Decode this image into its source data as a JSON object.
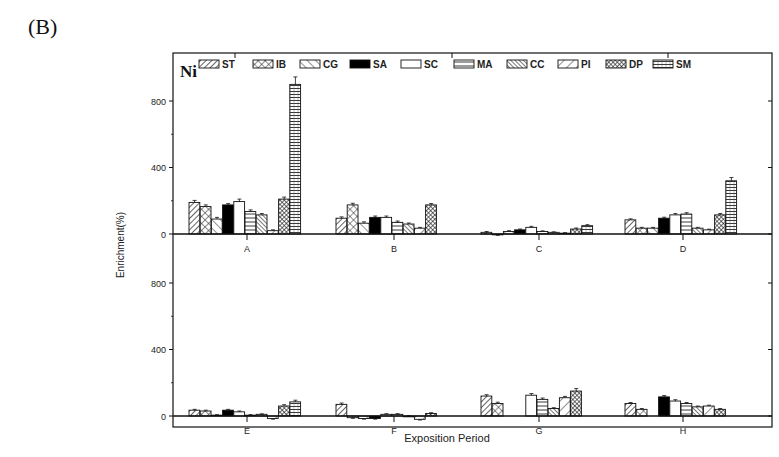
{
  "figure": {
    "panel_label": "(B)",
    "element_label": "Ni",
    "xlabel": "Exposition Period",
    "ylabel": "Enrichment(%)"
  },
  "legend": [
    {
      "key": "ST",
      "pattern": "diag-right"
    },
    {
      "key": "IB",
      "pattern": "crosshatch"
    },
    {
      "key": "CG",
      "pattern": "diag-left"
    },
    {
      "key": "SA",
      "pattern": "solid-black"
    },
    {
      "key": "SC",
      "pattern": "white"
    },
    {
      "key": "MA",
      "pattern": "horizontal"
    },
    {
      "key": "CC",
      "pattern": "dense-diag-left"
    },
    {
      "key": "PI",
      "pattern": "wide-diag-right"
    },
    {
      "key": "DP",
      "pattern": "dense-crosshatch"
    },
    {
      "key": "SM",
      "pattern": "horizontal-grid"
    }
  ],
  "chart_data": {
    "type": "bar",
    "title": "Ni",
    "xlabel": "Exposition Period",
    "ylabel": "Enrichment(%)",
    "series_names": [
      "ST",
      "IB",
      "CG",
      "SA",
      "SC",
      "MA",
      "CC",
      "PI",
      "DP",
      "SM"
    ],
    "panels": [
      {
        "position": "top",
        "ylim": [
          -40,
          1000
        ],
        "yticks": [
          0,
          400,
          800
        ],
        "categories": [
          "A",
          "B",
          "C",
          "D"
        ],
        "values": {
          "A": [
            190,
            165,
            90,
            175,
            195,
            135,
            115,
            20,
            210,
            900
          ],
          "B": [
            95,
            175,
            65,
            100,
            100,
            70,
            60,
            35,
            175,
            null
          ],
          "C": [
            10,
            -5,
            15,
            25,
            40,
            15,
            10,
            5,
            30,
            50
          ],
          "D": [
            85,
            35,
            35,
            95,
            115,
            120,
            35,
            25,
            115,
            320
          ]
        },
        "errors": {
          "A": [
            12,
            10,
            10,
            8,
            15,
            10,
            8,
            5,
            12,
            45
          ],
          "B": [
            8,
            10,
            8,
            8,
            8,
            8,
            6,
            5,
            8,
            null
          ],
          "C": [
            5,
            3,
            5,
            5,
            6,
            4,
            3,
            3,
            6,
            6
          ],
          "D": [
            6,
            5,
            5,
            6,
            8,
            8,
            5,
            4,
            8,
            20
          ]
        }
      },
      {
        "position": "bottom",
        "ylim": [
          -40,
          1000
        ],
        "yticks": [
          0,
          400,
          800
        ],
        "categories": [
          "E",
          "F",
          "G",
          "H"
        ],
        "values": {
          "E": [
            35,
            30,
            5,
            35,
            25,
            5,
            10,
            -15,
            60,
            85
          ],
          "F": [
            70,
            -10,
            -15,
            -15,
            10,
            10,
            0,
            -20,
            15,
            null
          ],
          "G": [
            120,
            75,
            null,
            null,
            125,
            100,
            45,
            110,
            150,
            null
          ],
          "H": [
            75,
            40,
            null,
            115,
            90,
            75,
            55,
            60,
            40,
            null
          ]
        },
        "errors": {
          "E": [
            5,
            5,
            3,
            5,
            5,
            3,
            3,
            4,
            8,
            10
          ],
          "F": [
            8,
            4,
            4,
            4,
            4,
            4,
            3,
            4,
            5,
            null
          ],
          "G": [
            8,
            8,
            null,
            null,
            10,
            8,
            5,
            8,
            15,
            null
          ],
          "H": [
            6,
            5,
            null,
            8,
            8,
            6,
            5,
            5,
            5,
            null
          ]
        }
      }
    ],
    "legend_position": "top-inside",
    "grid": false
  }
}
